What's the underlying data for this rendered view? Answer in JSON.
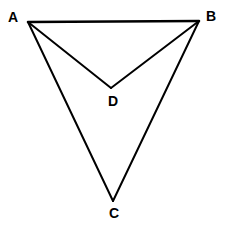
{
  "figure": {
    "background_color": "#ffffff",
    "stroke_color": "#000000",
    "label_color": "#000000",
    "width": 225,
    "height": 227,
    "points": {
      "A": {
        "label": "A",
        "x": 28,
        "y": 22,
        "label_x": 8,
        "label_y": 10
      },
      "B": {
        "label": "B",
        "x": 199,
        "y": 21,
        "label_x": 206,
        "label_y": 9
      },
      "C": {
        "label": "C",
        "x": 113,
        "y": 201,
        "label_x": 109,
        "label_y": 206
      },
      "D": {
        "label": "D",
        "x": 111,
        "y": 88,
        "label_x": 108,
        "label_y": 94
      }
    },
    "segments": [
      {
        "name": "AB",
        "from": "A",
        "to": "B",
        "stroke_width": 2.6
      },
      {
        "name": "AD",
        "from": "A",
        "to": "D",
        "stroke_width": 2.0
      },
      {
        "name": "BD",
        "from": "B",
        "to": "D",
        "stroke_width": 2.0
      },
      {
        "name": "AC",
        "from": "A",
        "to": "C",
        "stroke_width": 2.0
      },
      {
        "name": "BC",
        "from": "B",
        "to": "C",
        "stroke_width": 2.0
      }
    ]
  }
}
